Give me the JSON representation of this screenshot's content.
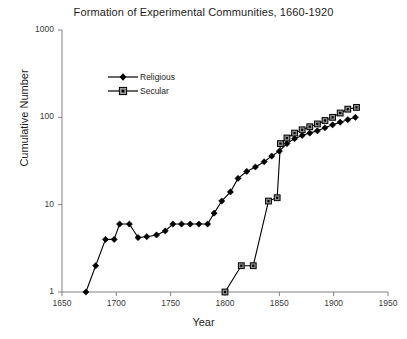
{
  "chart_data": {
    "type": "line",
    "title": "Formation of Experimental Communities, 1660-1920",
    "xlabel": "Year",
    "ylabel": "Cumulative Number",
    "xlim": [
      1650,
      1950
    ],
    "ylim": [
      1,
      1000
    ],
    "yscale": "log",
    "xscale": "linear",
    "grid": false,
    "legend_position": "upper-left-inside",
    "xticks": [
      1650,
      1700,
      1750,
      1800,
      1850,
      1900,
      1950
    ],
    "xtick_labels": [
      "1650",
      "1700",
      "1750",
      "1800",
      "1850",
      "1900",
      "1950"
    ],
    "yticks": [
      1,
      10,
      100,
      1000
    ],
    "ytick_labels": [
      "1",
      "10",
      "100",
      "1000"
    ],
    "series": [
      {
        "name": "Religious",
        "marker": "filled-diamond",
        "color": "#000000",
        "x": [
          1672,
          1681,
          1690,
          1698,
          1703,
          1712,
          1720,
          1728,
          1737,
          1745,
          1752,
          1760,
          1768,
          1776,
          1784,
          1790,
          1797,
          1805,
          1812,
          1820,
          1828,
          1836,
          1843,
          1850,
          1857,
          1864,
          1871,
          1878,
          1885,
          1892,
          1899,
          1906,
          1913,
          1920
        ],
        "y": [
          1,
          2,
          4,
          4,
          6,
          6,
          4.2,
          4.3,
          4.5,
          5,
          6,
          6,
          6,
          6,
          6,
          8,
          11,
          14,
          20,
          24,
          27,
          31,
          36,
          41,
          50,
          57,
          62,
          66,
          70,
          76,
          82,
          88,
          94,
          100
        ]
      },
      {
        "name": "Secular",
        "marker": "square",
        "color": "#000000",
        "x": [
          1800,
          1815,
          1826,
          1840,
          1848,
          1851,
          1857,
          1864,
          1871,
          1878,
          1885,
          1892,
          1899,
          1906,
          1913,
          1921
        ],
        "y": [
          1,
          2,
          2,
          11,
          12,
          50,
          58,
          66,
          72,
          78,
          84,
          92,
          100,
          112,
          124,
          130
        ]
      }
    ]
  },
  "legend": {
    "items": [
      {
        "label": "Religious"
      },
      {
        "label": "Secular"
      }
    ]
  }
}
